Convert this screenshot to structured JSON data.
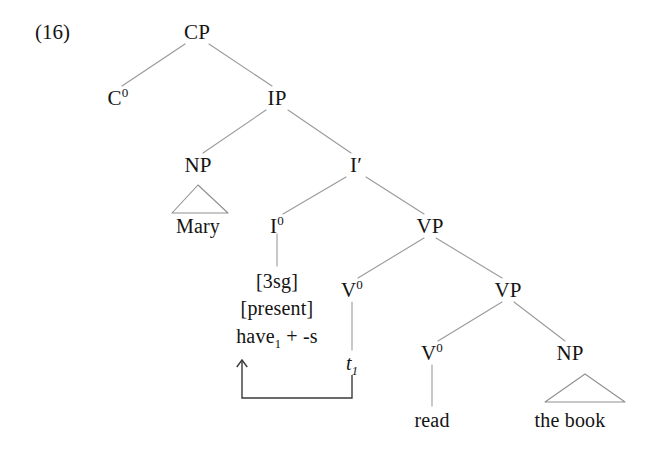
{
  "figure": {
    "example_number": "(16)",
    "type": "x-bar-syntax-tree",
    "sentence_gloss": "Mary have+-s read the book",
    "line_color": "#9a9a9a",
    "text_color": "#141414",
    "background_color": "#ffffff"
  },
  "nodes": {
    "cp": {
      "label": "CP",
      "x": 197,
      "y": 32
    },
    "c0_base": {
      "label": "C",
      "superscript": "0",
      "x": 118,
      "y": 98
    },
    "ip": {
      "label": "IP",
      "x": 277,
      "y": 98
    },
    "np_subject": {
      "label": "NP",
      "x": 198,
      "y": 165
    },
    "i_bar": {
      "label": "I",
      "prime": "′",
      "x": 356,
      "y": 165
    },
    "mary": {
      "label": "Mary",
      "x": 198,
      "y": 226
    },
    "i0": {
      "label": "I",
      "superscript": "0",
      "x": 277,
      "y": 226
    },
    "vp_upper": {
      "label": "VP",
      "x": 430,
      "y": 226
    },
    "feature_3sg": {
      "label": "[3sg]",
      "x": 277,
      "y": 281
    },
    "feature_present": {
      "label": "[present]",
      "x": 277,
      "y": 308
    },
    "have_affix": {
      "label": "have",
      "subscript": "1",
      "suffix": " + -s",
      "x": 277,
      "y": 336
    },
    "v0_upper": {
      "label": "V",
      "superscript": "0",
      "x": 352,
      "y": 290
    },
    "vp_lower": {
      "label": "VP",
      "x": 508,
      "y": 290
    },
    "trace_t1": {
      "label": "t",
      "subscript": "1",
      "x": 352,
      "y": 363
    },
    "v0_lower": {
      "label": "V",
      "superscript": "0",
      "x": 432,
      "y": 353
    },
    "np_object": {
      "label": "NP",
      "x": 570,
      "y": 353
    },
    "read": {
      "label": "read",
      "x": 432,
      "y": 420
    },
    "the_book": {
      "label": "the book",
      "x": 570,
      "y": 420
    }
  },
  "branches": [
    {
      "name": "cp-to-c0",
      "x1": 185,
      "y1": 44,
      "x2": 122,
      "y2": 86
    },
    {
      "name": "cp-to-ip",
      "x1": 209,
      "y1": 44,
      "x2": 272,
      "y2": 86
    },
    {
      "name": "ip-to-np",
      "x1": 266,
      "y1": 110,
      "x2": 203,
      "y2": 153
    },
    {
      "name": "ip-to-ibar",
      "x1": 288,
      "y1": 110,
      "x2": 351,
      "y2": 153
    },
    {
      "name": "ibar-to-i0",
      "x1": 346,
      "y1": 177,
      "x2": 283,
      "y2": 214
    },
    {
      "name": "ibar-to-vp-upper",
      "x1": 366,
      "y1": 177,
      "x2": 424,
      "y2": 214
    },
    {
      "name": "i0-to-features",
      "x1": 277,
      "y1": 234,
      "x2": 277,
      "y2": 266
    },
    {
      "name": "vp-upper-to-v0",
      "x1": 424,
      "y1": 238,
      "x2": 358,
      "y2": 278
    },
    {
      "name": "vp-upper-to-vp-lower",
      "x1": 436,
      "y1": 238,
      "x2": 502,
      "y2": 278
    },
    {
      "name": "v0-to-trace",
      "x1": 352,
      "y1": 302,
      "x2": 352,
      "y2": 350
    },
    {
      "name": "vp-lower-to-v0-lower",
      "x1": 502,
      "y1": 302,
      "x2": 438,
      "y2": 341
    },
    {
      "name": "vp-lower-to-np-object",
      "x1": 514,
      "y1": 302,
      "x2": 565,
      "y2": 341
    },
    {
      "name": "v0-lower-to-read",
      "x1": 432,
      "y1": 365,
      "x2": 432,
      "y2": 406
    }
  ],
  "triangles": [
    {
      "name": "mary-triangle",
      "apex_x": 198,
      "apex_y": 185,
      "left_x": 172,
      "right_x": 228,
      "base_y": 213
    },
    {
      "name": "the-book-triangle",
      "apex_x": 585,
      "apex_y": 374,
      "left_x": 545,
      "right_x": 625,
      "base_y": 402
    }
  ],
  "movement_arrow": {
    "name": "head-movement-arrow",
    "from_label": "t1",
    "to_label": "have1",
    "start_x": 352,
    "start_y": 375,
    "bottom_y": 398,
    "end_x": 242,
    "end_y": 360,
    "arrowhead_size": 7
  }
}
